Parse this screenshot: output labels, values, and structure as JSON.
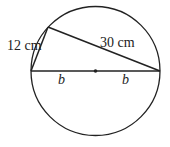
{
  "diagram": {
    "type": "circle-inscribed-triangle",
    "labels": {
      "short_side": "12 cm",
      "long_side": "30 cm",
      "radius_left": "b",
      "radius_right": "b"
    },
    "colors": {
      "stroke": "#222222",
      "background": "#ffffff"
    }
  }
}
